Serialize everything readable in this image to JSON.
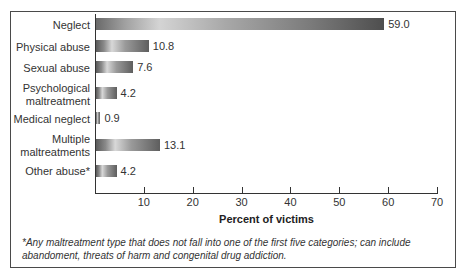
{
  "chart_data": {
    "type": "bar",
    "orientation": "horizontal",
    "title": "",
    "xlabel": "Percent of victims",
    "ylabel": "",
    "categories": [
      "Neglect",
      "Physical abuse",
      "Sexual abuse",
      "Psychological maltreatment",
      "Medical neglect",
      "Multiple maltreatments",
      "Other abuse*"
    ],
    "values": [
      59.0,
      10.8,
      7.6,
      4.2,
      0.9,
      13.1,
      4.2
    ],
    "value_labels": [
      "59.0",
      "10.8",
      "7.6",
      "4.2",
      "0.9",
      "13.1",
      "4.2"
    ],
    "xlim": [
      0,
      70
    ],
    "xticks": [
      10,
      20,
      30,
      40,
      50,
      60,
      70
    ],
    "grid": false,
    "legend": null,
    "footnote": "*Any maltreatment type that does not fall into one of the first five categories; can include abandoment, threats of harm and congenital drug addiction."
  },
  "labels": {
    "cat0": "Neglect",
    "cat1": "Physical abuse",
    "cat2": "Sexual abuse",
    "cat3a": "Psychological",
    "cat3b": "maltreatment",
    "cat4": "Medical neglect",
    "cat5a": "Multiple",
    "cat5b": "maltreatments",
    "cat6": "Other abuse*"
  },
  "ticks": [
    "10",
    "20",
    "30",
    "40",
    "50",
    "60",
    "70"
  ],
  "footnote_line1": "*Any maltreatment type that does not fall into one of the first five categories; can include",
  "footnote_line2": "abandoment, threats of harm and congenital drug addiction."
}
